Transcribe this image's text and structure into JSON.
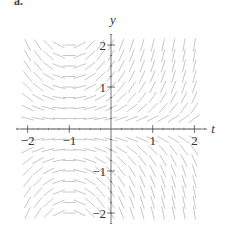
{
  "figure": {
    "panel_label": "a."
  },
  "chart_data": {
    "type": "direction_field",
    "title": "",
    "xlabel": "t",
    "ylabel": "y",
    "xlim": [
      -2.2,
      2.2
    ],
    "ylim": [
      -2.2,
      2.2
    ],
    "x_ticks": [
      -2,
      -1,
      1,
      2
    ],
    "y_ticks": [
      -2,
      -1,
      1,
      2
    ],
    "x_tick_labels": [
      "−2",
      "−1",
      "1",
      "2"
    ],
    "y_tick_labels": [
      "−2",
      "−1",
      "1",
      "2"
    ],
    "minor_tick_step": 0.25,
    "grid": false,
    "field_description": "Slope field consistent with dy/dt = (t + 1) y: zero slopes along t = -1 and y = 0; positive slopes for t > -1, y > 0; negative for t > -1, y < 0; reversed for t < -1.",
    "slope_function": "(t+1)*y",
    "sample_grid": {
      "t_start": -2.0,
      "t_end": 2.0,
      "t_step": 0.25,
      "y_start": -2.0,
      "y_end": 2.0,
      "y_step": 0.25
    },
    "segment_color": "#c8c8c8",
    "axis_color": "#555555"
  }
}
